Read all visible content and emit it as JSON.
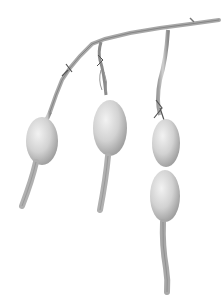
{
  "image": {
    "subject": "branch with hanging seed pods",
    "style": "grayscale photograph",
    "background": "#ffffff",
    "pod_count": 3,
    "colors": {
      "pod_light": "#e6e6e6",
      "pod_mid": "#c4c4c4",
      "pod_dark": "#8e8e8e",
      "stem": "#b8b8b8",
      "stem_dark": "#6a6a6a"
    }
  }
}
